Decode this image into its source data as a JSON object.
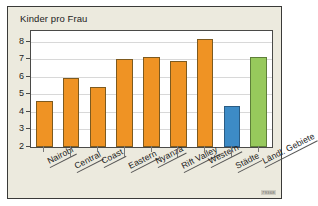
{
  "figure": {
    "title": "Kinder pro Frau",
    "corner_code": "79368",
    "background_color": "#eceade",
    "border_color": "#3a3a38",
    "plot_background": "#ffffff"
  },
  "colors": {
    "orange": "#ef9324",
    "blue": "#3d8bc6",
    "green": "#97c95c"
  },
  "chart_data": {
    "type": "bar",
    "title": "Kinder pro Frau",
    "xlabel": "",
    "ylabel": "",
    "ylim": [
      2,
      8.6
    ],
    "yticks": [
      2,
      3,
      4,
      5,
      6,
      7,
      8
    ],
    "ytick_labels": [
      "2",
      "3",
      "4",
      "5",
      "6",
      "7",
      "8"
    ],
    "grid": true,
    "legend": "none",
    "categories": [
      "Nairobi",
      "Central",
      "Coast",
      "Eastern",
      "Nyanza",
      "Rift Valley",
      "Western",
      "Städte",
      "Ländl. Gebiete"
    ],
    "values": [
      4.6,
      5.9,
      5.4,
      7.0,
      7.1,
      6.9,
      8.15,
      4.35,
      7.1
    ],
    "bar_colors": [
      "#ef9324",
      "#ef9324",
      "#ef9324",
      "#ef9324",
      "#ef9324",
      "#ef9324",
      "#ef9324",
      "#3d8bc6",
      "#97c95c"
    ],
    "color_classes": [
      "orange",
      "orange",
      "orange",
      "orange",
      "orange",
      "orange",
      "orange",
      "blue",
      "green"
    ]
  }
}
